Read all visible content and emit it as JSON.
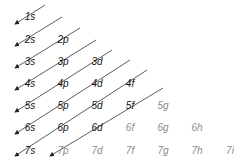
{
  "diagram": {
    "colors": {
      "line": "#333333",
      "filled_text": "#111111",
      "unfilled_text": "#8a8a8a"
    },
    "orbitals": [
      {
        "label": "1s",
        "col": 0,
        "row": 0,
        "filled": true
      },
      {
        "label": "2s",
        "col": 0,
        "row": 1,
        "filled": true
      },
      {
        "label": "2p",
        "col": 1,
        "row": 1,
        "filled": true
      },
      {
        "label": "3s",
        "col": 0,
        "row": 2,
        "filled": true
      },
      {
        "label": "3p",
        "col": 1,
        "row": 2,
        "filled": true
      },
      {
        "label": "3d",
        "col": 2,
        "row": 2,
        "filled": true
      },
      {
        "label": "4s",
        "col": 0,
        "row": 3,
        "filled": true
      },
      {
        "label": "4p",
        "col": 1,
        "row": 3,
        "filled": true
      },
      {
        "label": "4d",
        "col": 2,
        "row": 3,
        "filled": true
      },
      {
        "label": "4f",
        "col": 3,
        "row": 3,
        "filled": true
      },
      {
        "label": "5s",
        "col": 0,
        "row": 4,
        "filled": true
      },
      {
        "label": "5p",
        "col": 1,
        "row": 4,
        "filled": true
      },
      {
        "label": "5d",
        "col": 2,
        "row": 4,
        "filled": true
      },
      {
        "label": "5f",
        "col": 3,
        "row": 4,
        "filled": true
      },
      {
        "label": "5g",
        "col": 4,
        "row": 4,
        "filled": false
      },
      {
        "label": "6s",
        "col": 0,
        "row": 5,
        "filled": true
      },
      {
        "label": "6p",
        "col": 1,
        "row": 5,
        "filled": true
      },
      {
        "label": "6d",
        "col": 2,
        "row": 5,
        "filled": true
      },
      {
        "label": "6f",
        "col": 3,
        "row": 5,
        "filled": false
      },
      {
        "label": "6g",
        "col": 4,
        "row": 5,
        "filled": false
      },
      {
        "label": "6h",
        "col": 5,
        "row": 5,
        "filled": false
      },
      {
        "label": "7s",
        "col": 0,
        "row": 6,
        "filled": true
      },
      {
        "label": "7p",
        "col": 1,
        "row": 6,
        "filled": false
      },
      {
        "label": "7d",
        "col": 2,
        "row": 6,
        "filled": false
      },
      {
        "label": "7f",
        "col": 3,
        "row": 6,
        "filled": false
      },
      {
        "label": "7g",
        "col": 4,
        "row": 6,
        "filled": false
      },
      {
        "label": "7h",
        "col": 5,
        "row": 6,
        "filled": false
      },
      {
        "label": "7i",
        "col": 6,
        "row": 6,
        "filled": false
      }
    ],
    "arrows": [
      {
        "x1": 45,
        "y1": 5,
        "x2": 15,
        "y2": 24
      },
      {
        "x1": 62,
        "y1": 17,
        "x2": 15,
        "y2": 46
      },
      {
        "x1": 80,
        "y1": 28,
        "x2": 15,
        "y2": 68
      },
      {
        "x1": 96,
        "y1": 40,
        "x2": 15,
        "y2": 90
      },
      {
        "x1": 112,
        "y1": 50,
        "x2": 15,
        "y2": 112
      },
      {
        "x1": 130,
        "y1": 60,
        "x2": 15,
        "y2": 134
      },
      {
        "x1": 147,
        "y1": 70,
        "x2": 15,
        "y2": 156
      },
      {
        "x1": 163,
        "y1": 88,
        "x2": 50,
        "y2": 156
      }
    ]
  }
}
